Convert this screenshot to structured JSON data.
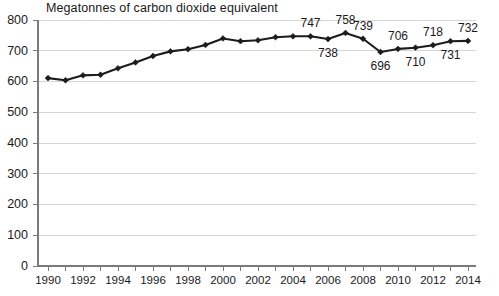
{
  "chart_data": {
    "type": "line",
    "title": "Megatonnes of carbon dioxide equivalent",
    "xlabel": "",
    "ylabel": "",
    "ylim": [
      0,
      800
    ],
    "yticks": [
      0,
      100,
      200,
      300,
      400,
      500,
      600,
      700,
      800
    ],
    "grid": true,
    "legend": false,
    "x": [
      1990,
      1991,
      1992,
      1993,
      1994,
      1995,
      1996,
      1997,
      1998,
      1999,
      2000,
      2001,
      2002,
      2003,
      2004,
      2005,
      2006,
      2007,
      2008,
      2009,
      2010,
      2011,
      2012,
      2013,
      2014
    ],
    "xticklabels": [
      "1990",
      "",
      "1992",
      "",
      "1994",
      "",
      "1996",
      "",
      "1998",
      "",
      "2000",
      "",
      "2002",
      "",
      "2004",
      "",
      "2006",
      "",
      "2008",
      "",
      "2010",
      "",
      "2012",
      "",
      "2014"
    ],
    "values": [
      611,
      604,
      620,
      622,
      643,
      662,
      683,
      698,
      705,
      719,
      740,
      731,
      734,
      744,
      747,
      747,
      738,
      758,
      739,
      696,
      706,
      710,
      718,
      731,
      732
    ],
    "series": [
      {
        "name": "Total greenhouse gas emissions",
        "values": [
          611,
          604,
          620,
          622,
          643,
          662,
          683,
          698,
          705,
          719,
          740,
          731,
          734,
          744,
          747,
          747,
          738,
          758,
          739,
          696,
          706,
          710,
          718,
          731,
          732
        ],
        "color": "#1c1c1c",
        "marker": "diamond"
      }
    ],
    "point_labels": [
      {
        "x": 2005,
        "value": 747,
        "text": "747",
        "position": "above"
      },
      {
        "x": 2006,
        "value": 738,
        "text": "738",
        "position": "below"
      },
      {
        "x": 2007,
        "value": 758,
        "text": "758",
        "position": "above"
      },
      {
        "x": 2008,
        "value": 739,
        "text": "739",
        "position": "above"
      },
      {
        "x": 2009,
        "value": 696,
        "text": "696",
        "position": "below"
      },
      {
        "x": 2010,
        "value": 706,
        "text": "706",
        "position": "above"
      },
      {
        "x": 2011,
        "value": 710,
        "text": "710",
        "position": "below"
      },
      {
        "x": 2012,
        "value": 718,
        "text": "718",
        "position": "above"
      },
      {
        "x": 2013,
        "value": 731,
        "text": "731",
        "position": "below"
      },
      {
        "x": 2014,
        "value": 732,
        "text": "732",
        "position": "above"
      }
    ],
    "colors": {
      "line": "#1c1c1c",
      "grid": "#d5d5d5",
      "axis": "#7a7a7a",
      "text": "#1a1a1a",
      "background": "#ffffff"
    }
  }
}
